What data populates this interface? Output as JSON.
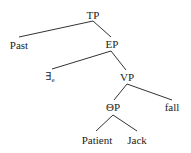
{
  "diagram": {
    "type": "syntax-tree",
    "nodes": [
      {
        "id": "tp",
        "label": "TP",
        "x": 93,
        "y": 15
      },
      {
        "id": "past",
        "label": "Past",
        "x": 19,
        "y": 45
      },
      {
        "id": "ep",
        "label": "EP",
        "x": 112,
        "y": 44
      },
      {
        "id": "exists",
        "label": "∃",
        "subscript": "e",
        "x": 50,
        "y": 77
      },
      {
        "id": "vp",
        "label": "VP",
        "x": 127,
        "y": 77
      },
      {
        "id": "thetap",
        "label": "ΘP",
        "x": 113,
        "y": 107
      },
      {
        "id": "fall",
        "label": "fall",
        "x": 172,
        "y": 107
      },
      {
        "id": "patient",
        "label": "Patient",
        "x": 97,
        "y": 140
      },
      {
        "id": "jack",
        "label": "Jack",
        "x": 137,
        "y": 140
      }
    ],
    "edges": [
      {
        "from": "tp",
        "to": "past"
      },
      {
        "from": "tp",
        "to": "ep"
      },
      {
        "from": "ep",
        "to": "exists"
      },
      {
        "from": "ep",
        "to": "vp"
      },
      {
        "from": "vp",
        "to": "thetap"
      },
      {
        "from": "vp",
        "to": "fall"
      },
      {
        "from": "thetap",
        "to": "patient"
      },
      {
        "from": "thetap",
        "to": "jack"
      }
    ]
  },
  "labels": {
    "tp": "TP",
    "past": "Past",
    "ep": "EP",
    "exists": "∃",
    "exists_sub": "e",
    "vp": "VP",
    "thetap": "ΘP",
    "fall": "fall",
    "patient": "Patient",
    "jack": "Jack"
  }
}
